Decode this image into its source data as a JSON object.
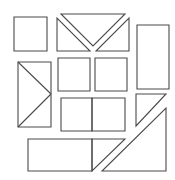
{
  "diagram": {
    "title": "",
    "stroke_color": "#4a4a4a",
    "background": "#ffffff",
    "shapes": [
      {
        "name": "square-top-left",
        "type": "polygon",
        "points": "14,17 47,17 47,51 14,51"
      },
      {
        "name": "triangle-top-center",
        "type": "polygon",
        "points": "61,14 125,14 93,46"
      },
      {
        "name": "triangle-left-of-envelope",
        "type": "polygon",
        "points": "57,18 57,51 90,51"
      },
      {
        "name": "triangle-right-of-envelope",
        "type": "polygon",
        "points": "129,18 129,51 96,51"
      },
      {
        "name": "tall-rectangle-right",
        "type": "polygon",
        "points": "137,25 169,25 169,89 137,89"
      },
      {
        "name": "rectangle-left-with-diagonals",
        "type": "polygon",
        "points": "18,62 51,62 51,127 18,127"
      },
      {
        "name": "square-middle-left",
        "type": "polygon",
        "points": "58,58 90,58 90,91 58,91"
      },
      {
        "name": "square-middle-right",
        "type": "polygon",
        "points": "95,58 127,58 127,91 95,91"
      },
      {
        "name": "square-lower-left",
        "type": "polygon",
        "points": "61,98 92,98 92,131 61,131"
      },
      {
        "name": "square-lower-right",
        "type": "polygon",
        "points": "92,98 125,98 125,131 92,131"
      },
      {
        "name": "triangle-small-right",
        "type": "polygon",
        "points": "136,94 166,94 136,126"
      },
      {
        "name": "triangle-large-bottom-right",
        "type": "polygon",
        "points": "166,108 166,171 102,171"
      },
      {
        "name": "rectangle-bottom",
        "type": "polygon",
        "points": "28,139 92,139 92,171 28,171"
      },
      {
        "name": "triangle-bottom",
        "type": "polygon",
        "points": "92,139 125,139 92,171"
      }
    ],
    "lines": [
      {
        "name": "diagonal-upper",
        "x1": 18,
        "y1": 62,
        "x2": 51,
        "y2": 94
      },
      {
        "name": "diagonal-lower",
        "x1": 51,
        "y1": 94,
        "x2": 18,
        "y2": 127
      }
    ]
  }
}
